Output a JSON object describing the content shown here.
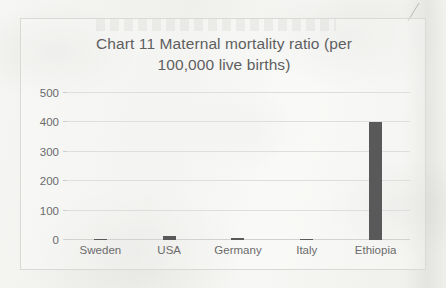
{
  "chart_data": {
    "type": "bar",
    "title": "Chart 11 Maternal mortality ratio (per 100,000 live births)",
    "title_line_1": "Chart 11 Maternal mortality ratio (per",
    "title_line_2": "100,000 live births)",
    "xlabel": "",
    "ylabel": "",
    "categories": [
      "Sweden",
      "USA",
      "Germany",
      "Italy",
      "Ethiopia"
    ],
    "values": [
      4,
      14,
      6,
      2,
      401
    ],
    "ylim": [
      0,
      500
    ],
    "y_ticks": [
      0,
      100,
      200,
      300,
      400,
      500
    ],
    "y_tick_labels": [
      "0",
      "100",
      "200",
      "300",
      "400",
      "500"
    ],
    "grid": true,
    "legend": false,
    "legend_position": "none",
    "bar_color": "#595959",
    "gridline_color": "#dedede",
    "title_color": "#5f5f5f",
    "tick_label_color": "#6b6b6b",
    "plot_background": "#ffffff",
    "frame_border_color": "#d9d9d6"
  }
}
